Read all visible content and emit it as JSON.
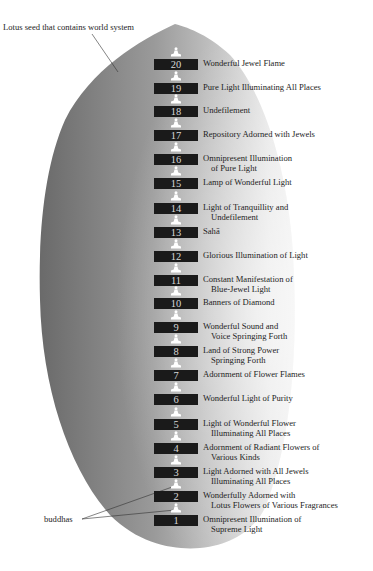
{
  "diagram": {
    "seed_label": "Lotus seed that contains world system",
    "buddhas_label": "buddhas",
    "colors": {
      "seed_dark": "#6e6e6e",
      "seed_light": "#e6e6e6",
      "numbox_bg": "#1a1a1a",
      "numbox_text": "#d8d8d8",
      "label_text": "#1e1e1e"
    },
    "worlds": [
      {
        "num": "20",
        "line1": "Wonderful Jewel Flame",
        "line2": ""
      },
      {
        "num": "19",
        "line1": "Pure Light Illuminating All Places",
        "line2": ""
      },
      {
        "num": "18",
        "line1": "Undefilement",
        "line2": ""
      },
      {
        "num": "17",
        "line1": "Repository Adorned with Jewels",
        "line2": ""
      },
      {
        "num": "16",
        "line1": "Omnipresent Illumination",
        "line2": "of Pure Light"
      },
      {
        "num": "15",
        "line1": "Lamp of Wonderful Light",
        "line2": ""
      },
      {
        "num": "14",
        "line1": "Light of Tranquillity and",
        "line2": "Undefilement"
      },
      {
        "num": "13",
        "line1": "Sahā",
        "line2": ""
      },
      {
        "num": "12",
        "line1": "Glorious Illumination of Light",
        "line2": ""
      },
      {
        "num": "11",
        "line1": "Constant Manifestation of",
        "line2": "Blue-Jewel Light"
      },
      {
        "num": "10",
        "line1": "Banners of Diamond",
        "line2": ""
      },
      {
        "num": "9",
        "line1": "Wonderful Sound and",
        "line2": "Voice Springing Forth"
      },
      {
        "num": "8",
        "line1": "Land of Strong Power",
        "line2": "Springing Forth"
      },
      {
        "num": "7",
        "line1": "Adornment of Flower Flames",
        "line2": ""
      },
      {
        "num": "6",
        "line1": "Wonderful Light of Purity",
        "line2": ""
      },
      {
        "num": "5",
        "line1": "Light of Wonderful Flower",
        "line2": "Illuminating All Places"
      },
      {
        "num": "4",
        "line1": "Adornment of Radiant Flowers of",
        "line2": "Various Kinds"
      },
      {
        "num": "3",
        "line1": "Light Adorned with All Jewels",
        "line2": "Illuminating All Places"
      },
      {
        "num": "2",
        "line1": "Wonderfully Adorned with",
        "line2": "Lotus Flowers of Various Fragrances"
      },
      {
        "num": "1",
        "line1": "Omnipresent Illumination of",
        "line2": "Supreme Light"
      }
    ]
  }
}
